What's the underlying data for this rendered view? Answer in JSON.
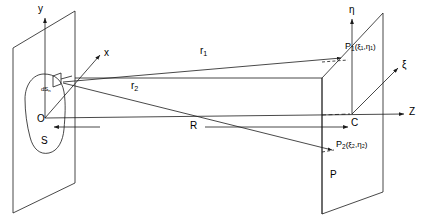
{
  "figure": {
    "type": "geometric-optics-diagram"
  },
  "colors": {
    "stroke": "#1a1a1a",
    "background": "#ffffff",
    "text": "#000000"
  },
  "axes": {
    "y": {
      "label": "y",
      "x": 38,
      "y": 4
    },
    "x": {
      "label": "x",
      "x": 104,
      "y": 48
    },
    "z": {
      "label": "Z",
      "x": 409,
      "y": 110
    },
    "eta": {
      "label": "η",
      "x": 352,
      "y": 5
    },
    "xi": {
      "label": "ξ",
      "x": 404,
      "y": 62
    }
  },
  "labels": {
    "origin": {
      "text": "O",
      "x": 37,
      "y": 119
    },
    "surface": {
      "text": "S",
      "x": 41,
      "y": 140
    },
    "center": {
      "text": "C",
      "x": 351,
      "y": 121
    },
    "plane": {
      "text": "P",
      "x": 330,
      "y": 173
    },
    "distance": {
      "text": "R",
      "x": 190,
      "y": 127
    },
    "ray1": {
      "text": "r",
      "sub": "1",
      "x": 200,
      "y": 52
    },
    "ray2": {
      "text": "r",
      "sub": "2",
      "x": 131,
      "y": 87
    },
    "area_element": {
      "text": "dS",
      "sub": "n",
      "x": 42,
      "y": 88
    }
  },
  "points": {
    "p1": {
      "text": "P",
      "sub": "1",
      "coords": "(ξ₁,η₁)",
      "x": 347,
      "y": 47
    },
    "p2": {
      "text": "P",
      "sub": "2",
      "coords": "(ξ₂,η₂)",
      "x": 337,
      "y": 145
    }
  }
}
